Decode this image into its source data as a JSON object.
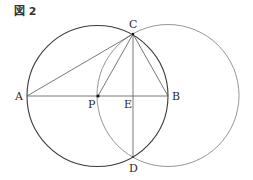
{
  "figure": {
    "title": "図 2",
    "points": {
      "A": {
        "label": "A",
        "x": 27,
        "y": 96
      },
      "B": {
        "label": "B",
        "x": 168,
        "y": 96
      },
      "C": {
        "label": "C",
        "x": 133,
        "y": 34
      },
      "D": {
        "label": "D",
        "x": 133,
        "y": 157
      },
      "E": {
        "label": "E",
        "x": 133,
        "y": 96
      },
      "P": {
        "label": "P",
        "x": 98,
        "y": 96
      }
    },
    "circles": [
      {
        "name": "circle-AB",
        "cx": 97.5,
        "cy": 96,
        "r": 70.5,
        "color": "#3a3a3a"
      },
      {
        "name": "circle-B",
        "cx": 168,
        "cy": 95.5,
        "r": 71,
        "color": "#8a8a8a"
      }
    ],
    "segments": [
      "AB",
      "AC",
      "CP",
      "CB",
      "CD"
    ]
  }
}
